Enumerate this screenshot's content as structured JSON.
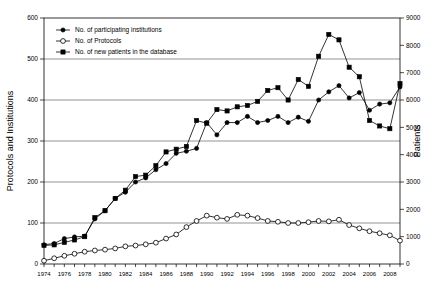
{
  "chart_data": {
    "type": "line",
    "title": "",
    "xlabel": "",
    "ylabel": "Protocols and Institutions",
    "y2label": "Patients",
    "ylim": [
      0,
      600
    ],
    "y2lim": [
      0,
      9000
    ],
    "xlim": [
      1974,
      2009
    ],
    "grid": true,
    "legend_position": "top-left",
    "yticks": [
      0,
      100,
      200,
      300,
      400,
      500,
      600
    ],
    "y2ticks": [
      0,
      1000,
      2000,
      3000,
      4000,
      5000,
      6000,
      7000,
      8000,
      9000
    ],
    "xticks": [
      1974,
      1975,
      1976,
      1977,
      1978,
      1979,
      1980,
      1981,
      1982,
      1983,
      1984,
      1985,
      1986,
      1987,
      1988,
      1989,
      1990,
      1991,
      1992,
      1993,
      1994,
      1995,
      1996,
      1997,
      1998,
      1999,
      2000,
      2001,
      2002,
      2003,
      2004,
      2005,
      2006,
      2007,
      2008,
      2009
    ],
    "xtick_labels": [
      "1974",
      "",
      "1976",
      "",
      "1978",
      "",
      "1980",
      "",
      "1982",
      "",
      "1984",
      "",
      "1986",
      "",
      "1988",
      "",
      "1990",
      "",
      "1992",
      "",
      "1994",
      "",
      "1996",
      "",
      "1998",
      "",
      "2000",
      "",
      "2002",
      "",
      "2004",
      "",
      "2006",
      "",
      "2008",
      ""
    ],
    "x": [
      1974,
      1975,
      1976,
      1977,
      1978,
      1979,
      1980,
      1981,
      1982,
      1983,
      1984,
      1985,
      1986,
      1987,
      1988,
      1989,
      1990,
      1991,
      1992,
      1993,
      1994,
      1995,
      1996,
      1997,
      1998,
      1999,
      2000,
      2001,
      2002,
      2003,
      2004,
      2005,
      2006,
      2007,
      2008,
      2009
    ],
    "series": [
      {
        "name": "No. of participating institutions",
        "marker": "filled-circle",
        "axis": "left",
        "values": [
          47,
          50,
          62,
          66,
          68,
          110,
          130,
          160,
          175,
          200,
          210,
          230,
          245,
          270,
          275,
          282,
          345,
          315,
          345,
          345,
          360,
          345,
          350,
          360,
          345,
          358,
          348,
          400,
          420,
          435,
          405,
          418,
          375,
          390,
          393,
          432
        ]
      },
      {
        "name": "No. of Protocols",
        "marker": "open-circle",
        "axis": "left",
        "values": [
          8,
          14,
          20,
          25,
          30,
          33,
          35,
          38,
          43,
          45,
          48,
          52,
          62,
          72,
          90,
          105,
          118,
          113,
          110,
          120,
          118,
          112,
          105,
          103,
          100,
          100,
          102,
          105,
          104,
          108,
          95,
          87,
          80,
          75,
          70,
          57
        ]
      },
      {
        "name": "No. of new patients in the database",
        "marker": "filled-square",
        "axis": "right",
        "values": [
          680,
          700,
          790,
          880,
          1000,
          1700,
          1950,
          2400,
          2700,
          3200,
          3250,
          3600,
          4100,
          4200,
          4300,
          5250,
          5150,
          5650,
          5600,
          5750,
          5800,
          5950,
          6350,
          6450,
          6000,
          6750,
          6500,
          7600,
          8400,
          8200,
          7200,
          6850,
          5250,
          5050,
          4950,
          6600
        ]
      }
    ],
    "legend": [
      {
        "label": "No. of participating institutions",
        "marker": "filled-circle"
      },
      {
        "label": "No. of Protocols",
        "marker": "open-circle"
      },
      {
        "label": "No. of new patients in the database",
        "marker": "filled-square"
      }
    ]
  },
  "colors": {
    "axis": "#000000",
    "grid": "#666666",
    "marker": "#000000",
    "background": "#ffffff"
  }
}
